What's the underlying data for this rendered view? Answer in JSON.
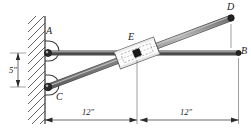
{
  "figure": {
    "background_color": "#ffffff",
    "ink_color": "#3a3a3a",
    "rod_fill_color": "#9a9a9a",
    "rod_edge_color": "#4a4a4a",
    "collar_fill_color": "#ffffff",
    "collar_edge_color": "#555555",
    "pin_color": "#1a1a1a",
    "wall_color": "#4a4a4a"
  },
  "labels": {
    "point_a": "A",
    "point_b": "B",
    "point_c": "C",
    "point_d": "D",
    "point_e": "E"
  },
  "dimensions": {
    "vertical_offset": "5″",
    "span_left": "12″",
    "span_right": "12″"
  },
  "geometry": {
    "wall_x": 45,
    "pivot_a": {
      "x": 48,
      "y": 53
    },
    "pivot_c": {
      "x": 48,
      "y": 87
    },
    "end_b": {
      "x": 239,
      "y": 53
    },
    "end_d": {
      "x": 231,
      "y": 18
    },
    "collar_e": {
      "x": 137,
      "y": 53
    },
    "rod_half_width": 2.6,
    "dimension_baseline_y": 120,
    "vertical_dim_x": 18
  }
}
